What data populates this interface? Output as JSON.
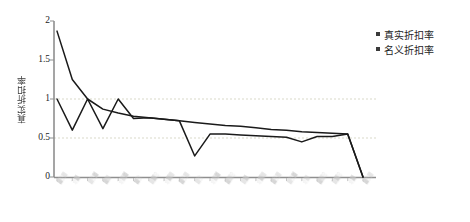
{
  "chart_data": {
    "type": "line",
    "title": "",
    "xlabel": "",
    "ylabel": "真实折扣率",
    "ylim": [
      0,
      2
    ],
    "yticks": [
      "0",
      "0.5",
      "1",
      "1.5",
      "2"
    ],
    "ytick_values": [
      0,
      0.5,
      1,
      1.5,
      2
    ],
    "grid": "horizontal-dashed at 0.5 and 1",
    "legend_position": "right",
    "x_tick_labels_legible": false,
    "categories": [
      "",
      "",
      "",
      "",
      "",
      "",
      "",
      "",
      "",
      "",
      "",
      "",
      "",
      "",
      "",
      "",
      "",
      "",
      "",
      "",
      ""
    ],
    "series": [
      {
        "name": "真实折扣率",
        "color": "#1a1a1a",
        "values": [
          1.87,
          1.25,
          1.0,
          0.87,
          0.82,
          0.78,
          0.76,
          0.74,
          0.72,
          0.7,
          0.68,
          0.66,
          0.65,
          0.63,
          0.61,
          0.6,
          0.58,
          0.57,
          0.56,
          0.55,
          0.0
        ]
      },
      {
        "name": "名义折扣率",
        "color": "#1a1a1a",
        "values": [
          1.0,
          0.6,
          1.0,
          0.62,
          1.0,
          0.75,
          0.76,
          0.74,
          0.72,
          0.27,
          0.55,
          0.55,
          0.54,
          0.53,
          0.52,
          0.51,
          0.45,
          0.52,
          0.52,
          0.55,
          0.0
        ]
      }
    ]
  },
  "axis": {
    "y_label": "真实折扣率",
    "y_ticks": [
      "2",
      "1.5",
      "1",
      "0.5",
      "0"
    ]
  },
  "legend": {
    "items": [
      {
        "label": "真实折扣率",
        "color": "#3a3a3a"
      },
      {
        "label": "名义折扣率",
        "color": "#3a3a3a"
      }
    ]
  },
  "x_axis": {
    "labels": [
      "▓░▒",
      "░▓",
      "▒░▓",
      "▓▒",
      "░▒▓",
      "▓░",
      "▒▓░",
      "░▓▒",
      "▓░▒",
      "▒░",
      "░▒▓",
      "▓▒░",
      "▒▓",
      "░▓▒",
      "▓░▒",
      "▒░▓",
      "░▒",
      "▓▒░",
      "▒▓░",
      "░▓",
      "▓░▒"
    ]
  }
}
